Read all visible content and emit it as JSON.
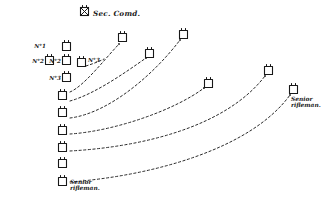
{
  "diagram": {
    "title": "Sec. Comd.",
    "title_icon": "section-commander-symbol",
    "background_color": "#ffffff",
    "ink_color": "#181818",
    "width": 330,
    "height": 203,
    "labels": {
      "no1": "N°1",
      "no2_left": "N°2",
      "no2_right": "N°2",
      "no3_left": "N°3",
      "no3_right": "N°3",
      "senior_rifleman_bottom": "Senior rifleman.",
      "senior_rifleman_right": "Senior rifleman."
    },
    "units": [
      {
        "id": "cmd",
        "name": "section-commander-marker",
        "x": 85,
        "y": 14,
        "label": "Sec. Comd."
      },
      {
        "id": "u-no1",
        "name": "unit-marker-no1",
        "x": 66,
        "y": 46,
        "label": "N°1"
      },
      {
        "id": "u-l2",
        "name": "unit-marker-left-no2",
        "x": 49,
        "y": 60,
        "label": "N°2"
      },
      {
        "id": "u-no2",
        "name": "unit-marker-no2",
        "x": 66,
        "y": 60,
        "label": "N°2"
      },
      {
        "id": "u-no3m",
        "name": "unit-marker-mid-no3",
        "x": 81,
        "y": 62,
        "label": "N°3"
      },
      {
        "id": "u-no3",
        "name": "unit-marker-no3",
        "x": 66,
        "y": 77,
        "label": "N°3"
      },
      {
        "id": "u-c1",
        "name": "unit-marker-column-1",
        "x": 62,
        "y": 95,
        "label": ""
      },
      {
        "id": "u-c2",
        "name": "unit-marker-column-2",
        "x": 62,
        "y": 112,
        "label": ""
      },
      {
        "id": "u-c3",
        "name": "unit-marker-column-3",
        "x": 62,
        "y": 130,
        "label": ""
      },
      {
        "id": "u-c4",
        "name": "unit-marker-column-4",
        "x": 62,
        "y": 147,
        "label": ""
      },
      {
        "id": "u-c5",
        "name": "unit-marker-column-5",
        "x": 62,
        "y": 163,
        "label": ""
      },
      {
        "id": "u-c6",
        "name": "unit-marker-column-6",
        "x": 62,
        "y": 181,
        "label": "Senior rifleman."
      },
      {
        "id": "u-t1",
        "name": "unit-marker-advance-1",
        "x": 122,
        "y": 37,
        "label": ""
      },
      {
        "id": "u-t2",
        "name": "unit-marker-advance-2",
        "x": 149,
        "y": 53,
        "label": ""
      },
      {
        "id": "u-t3",
        "name": "unit-marker-advance-3",
        "x": 183,
        "y": 34,
        "label": ""
      },
      {
        "id": "u-t4",
        "name": "unit-marker-advance-4",
        "x": 208,
        "y": 83,
        "label": ""
      },
      {
        "id": "u-t5",
        "name": "unit-marker-advance-5",
        "x": 268,
        "y": 70,
        "label": "Senior rifleman."
      },
      {
        "id": "u-t6",
        "name": "unit-marker-advance-6",
        "x": 293,
        "y": 89,
        "label": "Senior rifleman."
      }
    ],
    "routes": [
      {
        "id": "r1",
        "name": "route-no3-to-advance-1",
        "from": "u-no3",
        "to": "u-t1",
        "d": "M 70 92 C 84 86 104 60 119 44"
      },
      {
        "id": "r2",
        "name": "route-column1-to-advance-2",
        "from": "u-c1",
        "to": "u-t2",
        "d": "M 70 101 C 95 94 126 72 146 58"
      },
      {
        "id": "r3",
        "name": "route-column2-to-advance-3",
        "from": "u-c2",
        "to": "u-t3",
        "d": "M 70 118 C 110 113 155 73 180 40"
      },
      {
        "id": "r4",
        "name": "route-column3-to-advance-4",
        "from": "u-c3",
        "to": "u-t4",
        "d": "M 70 134 C 115 131 175 110 204 88"
      },
      {
        "id": "r5",
        "name": "route-column4-to-advance-5",
        "from": "u-c4",
        "to": "u-t5",
        "d": "M 70 151 C 140 147 225 128 265 76"
      },
      {
        "id": "r6",
        "name": "route-column6-to-advance-6",
        "from": "u-c6",
        "to": "u-t6",
        "d": "M 70 182 C 150 176 250 150 290 95"
      }
    ]
  }
}
